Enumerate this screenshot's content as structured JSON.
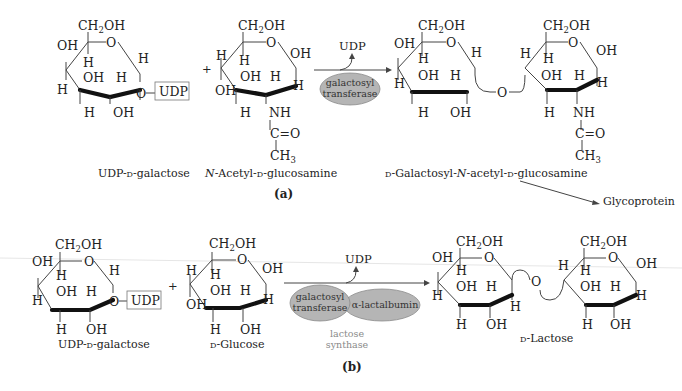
{
  "panel_a": {
    "label": "(a)",
    "reactant1": {
      "name": "UDP-D-galactose",
      "name_parts": [
        "UDP-",
        "D",
        "-galactose"
      ],
      "ch2oh": "CH2OH",
      "ring_o": "O",
      "substituents": {
        "c4_up": "OH",
        "c4_down": "H",
        "c5_h": "H",
        "c3_up": "OH",
        "c3_down": "H",
        "c2_up": "H",
        "c2_down": "OH",
        "c1_up": "H",
        "c1_link": "O",
        "udp": "UDP"
      }
    },
    "plus": "+",
    "reactant2": {
      "name": "N-Acetyl-D-glucosamine",
      "name_parts": [
        "N",
        "-Acetyl-",
        "D",
        "-glucosamine"
      ],
      "ch2oh": "CH2OH",
      "ring_o": "O",
      "substituents": {
        "c4_up": "H",
        "c4_down": "OH",
        "c5_h": "H",
        "c3_up": "OH",
        "c3_down": "H",
        "c2_up": "H",
        "c2_down": "NH",
        "c1_up": "OH",
        "c1_down": "H",
        "carbonyl": "C=O",
        "methyl": "CH3"
      }
    },
    "arrow": {
      "byproduct": "UDP",
      "enzyme": [
        "galactosyl",
        "transferase"
      ]
    },
    "product": {
      "name": "D-Galactosyl-N-acetyl-D-glucosamine",
      "name_parts": [
        "D",
        "-Galactosyl-",
        "N",
        "-acetyl-",
        "D",
        "-glucosamine"
      ],
      "link_o": "O",
      "next": "Glycoprotein"
    }
  },
  "panel_b": {
    "label": "(b)",
    "reactant1": {
      "name": "UDP-D-galactose",
      "name_parts": [
        "UDP-",
        "D",
        "-galactose"
      ],
      "udp": "UDP"
    },
    "plus": "+",
    "reactant2": {
      "name": "D-Glucose",
      "name_parts": [
        "D",
        "-Glucose"
      ]
    },
    "arrow": {
      "byproduct": "UDP",
      "enzyme1": [
        "galactosyl",
        "transferase"
      ],
      "enzyme2": "α-lactalbumin",
      "complex": [
        "lactose",
        "synthase"
      ]
    },
    "product": {
      "name": "D-Lactose",
      "name_parts": [
        "D",
        "-Lactose"
      ],
      "link_o": "O"
    }
  },
  "colors": {
    "enzyme_fill": "#b5b5b5",
    "complex_label": "#8a8a8a",
    "ink": "#222222"
  }
}
